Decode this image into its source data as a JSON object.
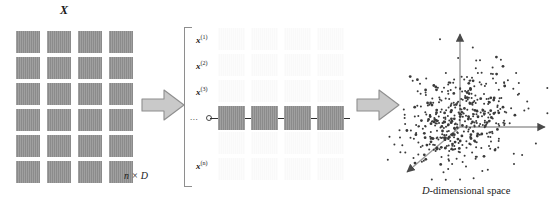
{
  "figure": {
    "background": "#ffffff",
    "width": 560,
    "height": 210
  },
  "colors": {
    "cell_fill": "#8b8b8b",
    "ghost_fill": "#f4f4f4",
    "arrow_fill": "#c9c9c9",
    "arrow_stroke": "#8e8e8e",
    "axis": "#6f6f6f",
    "point": "#3a3a3a",
    "bracket": "#8e8e8e",
    "text": "#1a1a1a"
  },
  "matrix_panel": {
    "title": "X",
    "dims_label": "n × D",
    "rows": 6,
    "cols": 4,
    "cells": [
      [
        "",
        "",
        "",
        ""
      ],
      [
        "",
        "",
        "",
        ""
      ],
      [
        "",
        "",
        "",
        ""
      ],
      [
        "",
        "",
        "",
        ""
      ],
      [
        "",
        "",
        "",
        ""
      ],
      [
        "",
        "",
        "",
        ""
      ]
    ]
  },
  "arrow_one": {
    "name": "arrow-right-1",
    "label": ""
  },
  "arrow_two": {
    "name": "arrow-right-2",
    "label": ""
  },
  "rows_panel": {
    "ellipsis": "...",
    "row_labels": [
      {
        "base": "x",
        "sup": "(1)",
        "faded": false
      },
      {
        "base": "x",
        "sup": "(2)",
        "faded": false
      },
      {
        "base": "x",
        "sup": "(3)",
        "faded": false
      },
      {
        "base": "x",
        "sup": "(n)",
        "faded": false
      }
    ],
    "ghost_rows": 6,
    "ghost_cols": 4,
    "selected_row_cells": [
      "",
      "",
      "",
      ""
    ]
  },
  "scatter_panel": {
    "caption_italic": "D",
    "caption_rest": "-dimensional space",
    "axes": [
      {
        "name": "vertical-axis",
        "direction": "up"
      },
      {
        "name": "horizontal-axis",
        "direction": "right"
      },
      {
        "name": "depth-axis",
        "direction": "down-left"
      }
    ],
    "point_count": 470
  },
  "chart_data": {
    "type": "scatter",
    "title": "D-dimensional space",
    "xlabel": "",
    "ylabel": "",
    "grid": false,
    "legend": false,
    "axes_style": "3d-projection-arrows",
    "n_points": 470
  }
}
